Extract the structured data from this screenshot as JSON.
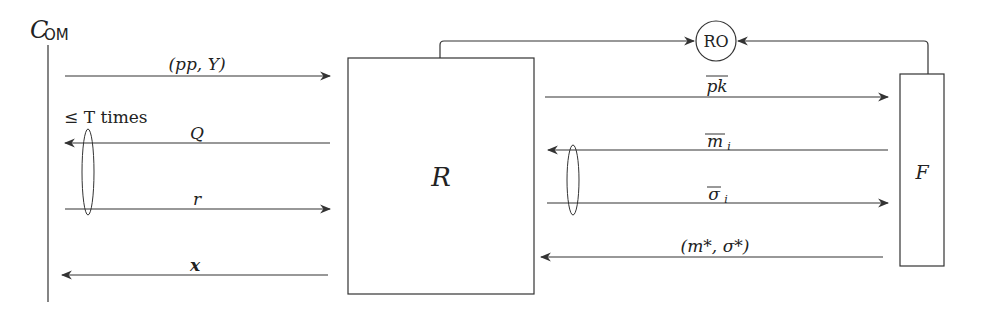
{
  "diagram": {
    "participant_left": {
      "name": "C",
      "subscript": "OM"
    },
    "box_center": {
      "label": "R"
    },
    "box_right": {
      "label": "F"
    },
    "oracle": {
      "label": "RO"
    },
    "repeat_note": "≤ T times",
    "left_messages": [
      {
        "label": "(pp, Y)",
        "direction": "right"
      },
      {
        "label": "Q",
        "direction": "left"
      },
      {
        "label": "r",
        "direction": "right"
      },
      {
        "label": "x",
        "direction": "left"
      }
    ],
    "right_messages": [
      {
        "label": "pk",
        "overline": true,
        "direction": "right"
      },
      {
        "label": "m",
        "subscript": "i",
        "overline": true,
        "direction": "left"
      },
      {
        "label": "σ",
        "subscript": "i",
        "overline": true,
        "direction": "right"
      },
      {
        "label": "(m*, σ*)",
        "direction": "left"
      }
    ],
    "colors": {
      "stroke": "#333333",
      "background": "#ffffff"
    }
  }
}
